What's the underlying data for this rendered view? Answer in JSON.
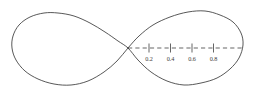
{
  "figure": {
    "name": "lemniscate-plot",
    "background_color": "#ffffff",
    "curve_color": "#3a3a3a",
    "axis_color": "#4a4a4a",
    "label_color": "#3d3d3d",
    "width": 254,
    "height": 99
  },
  "chart_data": {
    "type": "line",
    "title": "",
    "subtitle": "",
    "xlabel": "",
    "ylabel": "",
    "grid": false,
    "legend": null,
    "curve_name": "lemniscate",
    "curve_description": "figure-eight (lemniscate) closed curve with two lobes crossing at the origin",
    "axis": {
      "orientation": "horizontal",
      "style": "dashed",
      "origin_px": {
        "x": 128,
        "y": 48
      },
      "start_px": {
        "x": 128,
        "y": 48
      },
      "end_px": {
        "x": 242,
        "y": 48
      },
      "visible_range": [
        0.0,
        1.0
      ],
      "ticks": [
        {
          "label": "0.2",
          "value": 0.2,
          "x_px": 149
        },
        {
          "label": "0.4",
          "value": 0.4,
          "x_px": 170.5
        },
        {
          "label": "0.6",
          "value": 0.6,
          "x_px": 192
        },
        {
          "label": "0.8",
          "value": 0.8,
          "x_px": 213.5
        }
      ],
      "tick_labels": [
        "0.2",
        "0.4",
        "0.6",
        "0.8"
      ],
      "tick_values": [
        0.2,
        0.4,
        0.6,
        0.8
      ]
    },
    "geometry": {
      "crossing_point_px": {
        "x": 128,
        "y": 48
      },
      "left_lobe": {
        "x_min_px": 12,
        "x_max_px": 128,
        "y_top_px": 12,
        "y_bottom_px": 86
      },
      "right_lobe": {
        "x_min_px": 128,
        "x_max_px": 243,
        "y_top_px": 11,
        "y_bottom_px": 85
      }
    },
    "series": [
      {
        "name": "lemniscate",
        "points_px": [
          [
            128,
            48
          ],
          [
            118,
            41
          ],
          [
            105,
            32
          ],
          [
            90,
            23
          ],
          [
            74,
            16
          ],
          [
            58,
            13
          ],
          [
            44,
            13
          ],
          [
            30,
            17
          ],
          [
            19,
            25
          ],
          [
            13,
            36
          ],
          [
            12,
            48
          ],
          [
            16,
            60
          ],
          [
            25,
            71
          ],
          [
            38,
            79
          ],
          [
            54,
            84
          ],
          [
            71,
            85
          ],
          [
            88,
            81
          ],
          [
            104,
            72
          ],
          [
            117,
            61
          ],
          [
            128,
            48
          ],
          [
            139,
            36
          ],
          [
            153,
            25
          ],
          [
            170,
            17
          ],
          [
            188,
            12
          ],
          [
            205,
            11
          ],
          [
            220,
            15
          ],
          [
            233,
            22
          ],
          [
            241,
            33
          ],
          [
            243,
            45
          ],
          [
            239,
            58
          ],
          [
            230,
            69
          ],
          [
            217,
            78
          ],
          [
            201,
            83
          ],
          [
            184,
            85
          ],
          [
            167,
            81
          ],
          [
            151,
            72
          ],
          [
            138,
            60
          ],
          [
            128,
            48
          ]
        ]
      }
    ]
  }
}
